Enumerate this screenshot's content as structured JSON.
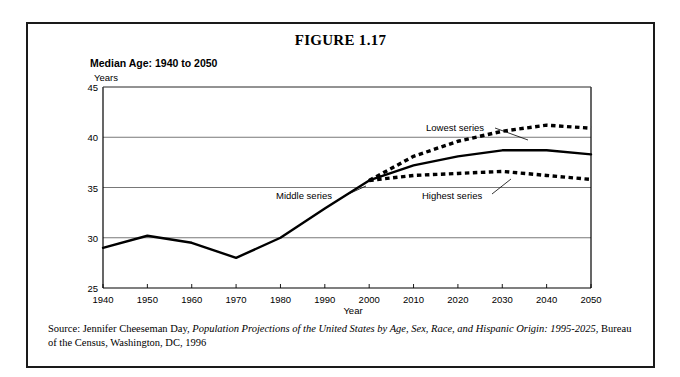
{
  "figure": {
    "title": "FIGURE 1.17",
    "subtitle": "Median Age: 1940 to 2050",
    "source_prefix": "Source: Jennifer Cheeseman Day,",
    "source_title": "Population Projections of the United States by Age, Sex, Race, and Hispanic Origin: 1995-2025",
    "source_suffix": ", Bureau of the Census, Washington, DC, 1996"
  },
  "chart_data": {
    "type": "line",
    "title": "Median Age: 1940 to 2050",
    "xlabel": "Year",
    "ylabel": "Years",
    "xlim": [
      1940,
      2050
    ],
    "ylim": [
      25,
      45
    ],
    "xticks": [
      1940,
      1950,
      1960,
      1970,
      1980,
      1990,
      2000,
      2010,
      2020,
      2030,
      2040,
      2050
    ],
    "yticks": [
      25,
      30,
      35,
      40,
      45
    ],
    "grid": "horizontal",
    "legend": "inline-annotations",
    "annotations": [
      {
        "text": "Lowest series",
        "series": "Lowest series"
      },
      {
        "text": "Middle series",
        "series": "Middle series"
      },
      {
        "text": "Highest series",
        "series": "Highest series"
      }
    ],
    "series": [
      {
        "name": "Historical",
        "style": "solid",
        "x": [
          1940,
          1950,
          1960,
          1970,
          1980,
          1990,
          2000
        ],
        "values": [
          29.0,
          30.2,
          29.5,
          28.0,
          30.0,
          32.9,
          35.7
        ]
      },
      {
        "name": "Lowest series",
        "style": "dotted",
        "x": [
          2000,
          2010,
          2020,
          2030,
          2040,
          2050
        ],
        "values": [
          35.7,
          38.1,
          39.6,
          40.6,
          41.2,
          40.9
        ]
      },
      {
        "name": "Middle series",
        "style": "solid",
        "x": [
          2000,
          2010,
          2020,
          2030,
          2040,
          2050
        ],
        "values": [
          35.7,
          37.2,
          38.1,
          38.7,
          38.7,
          38.3
        ]
      },
      {
        "name": "Highest series",
        "style": "dotted",
        "x": [
          2000,
          2010,
          2020,
          2030,
          2040,
          2050
        ],
        "values": [
          35.7,
          36.2,
          36.4,
          36.6,
          36.2,
          35.8
        ]
      }
    ]
  }
}
